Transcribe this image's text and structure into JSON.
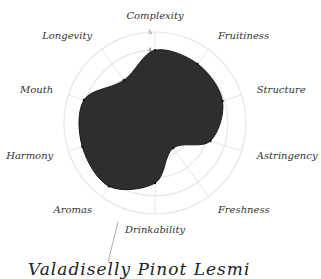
{
  "chart_data": {
    "type": "radar",
    "title": "",
    "categories": [
      "Complexity",
      "Fruitiness",
      "Structure",
      "Astringency",
      "Freshness",
      "Drinkability",
      "Aromas",
      "Harmony",
      "Mouth",
      "Longevity"
    ],
    "series": [
      {
        "name": "wine profile",
        "values": [
          4.0,
          4.0,
          3.9,
          3.2,
          1.7,
          3.3,
          4.3,
          4.2,
          4.1,
          2.9
        ]
      }
    ],
    "rlim": [
      0,
      5
    ],
    "ticks": [
      "4",
      "5"
    ],
    "grid": true,
    "fill_color": "#2e2e2e",
    "grid_color": "#e6e6e6"
  },
  "caption": "Valadiselly Pinot Lesmi"
}
